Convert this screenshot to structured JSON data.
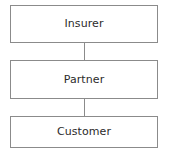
{
  "diagram": {
    "type": "flow-chain",
    "orientation": "vertical",
    "colors": {
      "background": "#ffffff",
      "box_fill": "#ffffff",
      "box_border": "#8b8b8b",
      "connector": "#8b8b8b",
      "text": "#2b2b2b"
    },
    "nodes": [
      {
        "id": "insurer",
        "label": "Insurer"
      },
      {
        "id": "partner",
        "label": "Partner"
      },
      {
        "id": "customer",
        "label": "Customer"
      }
    ],
    "connectors": [
      {
        "id": "insurer-partner",
        "from": "insurer",
        "to": "partner",
        "style": "plain-line"
      },
      {
        "id": "partner-customer",
        "from": "partner",
        "to": "customer",
        "style": "plain-line"
      }
    ]
  }
}
